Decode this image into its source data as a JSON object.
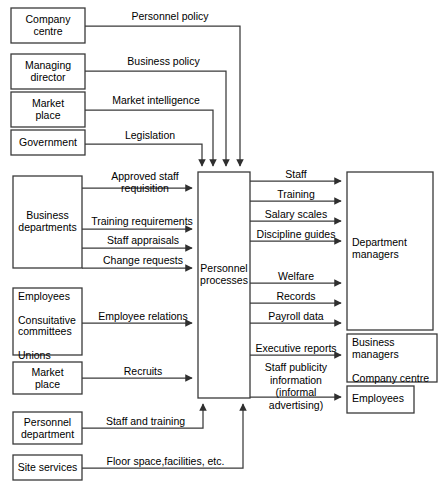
{
  "diagram": {
    "type": "data-flow-diagram",
    "canvas": {
      "width": 442,
      "height": 489
    },
    "colors": {
      "background": "#ffffff",
      "stroke": "#3a3a3a",
      "text": "#000000"
    },
    "nodes": [
      {
        "id": "company-centre",
        "label": "Company\ncentre",
        "x": 11,
        "y": 8,
        "w": 74,
        "h": 35
      },
      {
        "id": "managing-director",
        "label": "Managing\ndirector",
        "x": 11,
        "y": 54,
        "w": 74,
        "h": 35
      },
      {
        "id": "market-place-top",
        "label": "Market\nplace",
        "x": 11,
        "y": 92,
        "w": 74,
        "h": 35
      },
      {
        "id": "government",
        "label": "Government",
        "x": 11,
        "y": 130,
        "w": 74,
        "h": 25
      },
      {
        "id": "business-departments",
        "label": "Business\ndepartments",
        "x": 13,
        "y": 176,
        "w": 69,
        "h": 92
      },
      {
        "id": "employees-unions",
        "label": "Employees\n\nConsuitative\ncommittees\n\nUnions",
        "x": 13,
        "y": 288,
        "w": 69,
        "h": 67
      },
      {
        "id": "market-place-bottom",
        "label": "Market\nplace",
        "x": 13,
        "y": 362,
        "w": 69,
        "h": 32
      },
      {
        "id": "personnel-department",
        "label": "Personnel\ndepartment",
        "x": 13,
        "y": 412,
        "w": 69,
        "h": 32
      },
      {
        "id": "site-services",
        "label": "Site services",
        "x": 13,
        "y": 455,
        "w": 69,
        "h": 25
      },
      {
        "id": "personnel-processes",
        "label": "Personnel\nprocesses",
        "x": 198,
        "y": 172,
        "w": 52,
        "h": 226
      },
      {
        "id": "department-managers",
        "label": "Department\nmanagers",
        "x": 347,
        "y": 172,
        "w": 86,
        "h": 158
      },
      {
        "id": "business-managers",
        "label": "Business\nmanagers\n\nCompany centre",
        "x": 347,
        "y": 334,
        "w": 90,
        "h": 48
      },
      {
        "id": "employees-out",
        "label": "Employees",
        "x": 347,
        "y": 386,
        "w": 67,
        "h": 27
      }
    ],
    "flows_top": [
      {
        "id": "personnel-policy",
        "label": "Personnel policy",
        "from": "company-centre",
        "to": "personnel-processes"
      },
      {
        "id": "business-policy",
        "label": "Business policy",
        "from": "managing-director",
        "to": "personnel-processes"
      },
      {
        "id": "market-intelligence",
        "label": "Market intelligence",
        "from": "market-place-top",
        "to": "personnel-processes"
      },
      {
        "id": "legislation",
        "label": "Legislation",
        "from": "government",
        "to": "personnel-processes"
      }
    ],
    "flows_left": [
      {
        "id": "approved-staff-requisition",
        "label": "Approved staff\nrequisition",
        "from": "business-departments",
        "to": "personnel-processes"
      },
      {
        "id": "training-requirements",
        "label": "Training requirements",
        "from": "business-departments",
        "to": "personnel-processes"
      },
      {
        "id": "staff-appraisals",
        "label": "Staff appraisals",
        "from": "business-departments",
        "to": "personnel-processes"
      },
      {
        "id": "change-requests",
        "label": "Change requests",
        "from": "business-departments",
        "to": "personnel-processes"
      },
      {
        "id": "employee-relations",
        "label": "Employee relations",
        "from": "employees-unions",
        "to": "personnel-processes"
      },
      {
        "id": "recruits",
        "label": "Recruits",
        "from": "market-place-bottom",
        "to": "personnel-processes"
      }
    ],
    "flows_bottom": [
      {
        "id": "staff-and-training",
        "label": "Staff and training",
        "from": "personnel-department",
        "to": "personnel-processes"
      },
      {
        "id": "floor-space",
        "label": "Floor space,facilities, etc.",
        "from": "site-services",
        "to": "personnel-processes"
      }
    ],
    "flows_right": [
      {
        "id": "staff",
        "label": "Staff",
        "from": "personnel-processes",
        "to": "department-managers"
      },
      {
        "id": "training",
        "label": "Training",
        "from": "personnel-processes",
        "to": "department-managers"
      },
      {
        "id": "salary-scales",
        "label": "Salary scales",
        "from": "personnel-processes",
        "to": "department-managers"
      },
      {
        "id": "discipline-guides",
        "label": "Discipline guides",
        "from": "personnel-processes",
        "to": "department-managers"
      },
      {
        "id": "welfare",
        "label": "Welfare",
        "from": "personnel-processes",
        "to": "department-managers"
      },
      {
        "id": "records",
        "label": "Records",
        "from": "personnel-processes",
        "to": "department-managers"
      },
      {
        "id": "payroll-data",
        "label": "Payroll data",
        "from": "personnel-processes",
        "to": "department-managers"
      },
      {
        "id": "executive-reports",
        "label": "Executive reports",
        "from": "personnel-processes",
        "to": "business-managers"
      },
      {
        "id": "staff-publicity",
        "label": "Staff publicity\ninformation\n(informal\nadvertising)",
        "from": "personnel-processes",
        "to": "employees-out"
      }
    ]
  }
}
